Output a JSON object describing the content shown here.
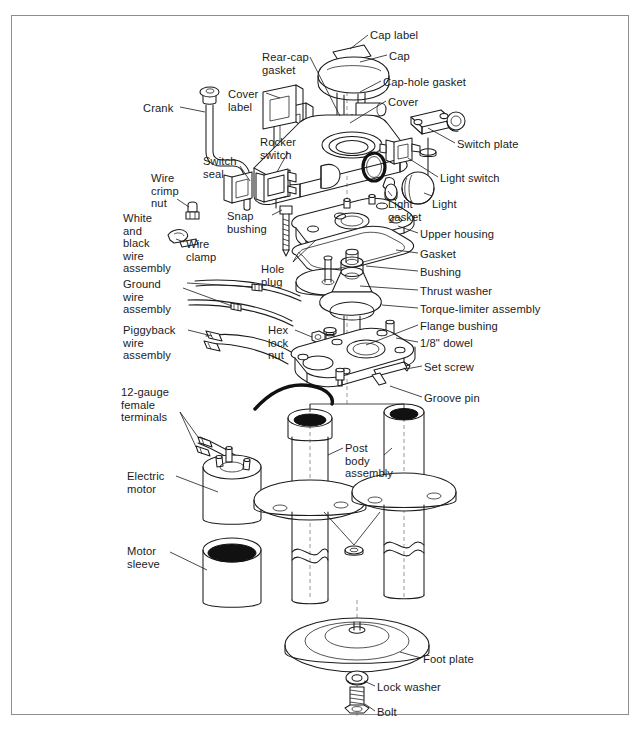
{
  "document": {
    "type": "exploded-parts-diagram",
    "subject": "Electric post / motorized column assembly",
    "border_color": "#8d8d8d",
    "line_color": "#1b1b1b",
    "background": "#ffffff"
  },
  "labels": [
    {
      "id": "cap-label",
      "text": "Cap label",
      "x": 370,
      "y": 29,
      "align": "left"
    },
    {
      "id": "cap",
      "text": "Cap",
      "x": 389,
      "y": 50,
      "align": "left"
    },
    {
      "id": "cap-hole-gasket",
      "text": "Cap-hole gasket",
      "x": 383,
      "y": 76,
      "align": "left"
    },
    {
      "id": "cover",
      "text": "Cover",
      "x": 388,
      "y": 96,
      "align": "left"
    },
    {
      "id": "rear-cap-gasket",
      "text": "Rear-cap\ngasket",
      "x": 262,
      "y": 51,
      "align": "left"
    },
    {
      "id": "cover-label",
      "text": "Cover\nlabel",
      "x": 228,
      "y": 88,
      "align": "left"
    },
    {
      "id": "crank",
      "text": "Crank",
      "x": 143,
      "y": 102,
      "align": "left"
    },
    {
      "id": "rocker-switch",
      "text": "Rocker\nswitch",
      "x": 260,
      "y": 136,
      "align": "left"
    },
    {
      "id": "switch-plate",
      "text": "Switch plate",
      "x": 457,
      "y": 138,
      "align": "left"
    },
    {
      "id": "switch-seal",
      "text": "Switch\nseal",
      "x": 203,
      "y": 155,
      "align": "left"
    },
    {
      "id": "light-switch",
      "text": "Light switch",
      "x": 440,
      "y": 172,
      "align": "left"
    },
    {
      "id": "wire-crimp-nut",
      "text": "Wire\ncrimp\nnut",
      "x": 151,
      "y": 172,
      "align": "left"
    },
    {
      "id": "light",
      "text": "Light",
      "x": 432,
      "y": 198,
      "align": "left"
    },
    {
      "id": "light-gasket",
      "text": "Light\ngasket",
      "x": 388,
      "y": 198,
      "align": "left"
    },
    {
      "id": "snap-bushing",
      "text": "Snap\nbushing",
      "x": 227,
      "y": 210,
      "align": "left"
    },
    {
      "id": "upper-housing",
      "text": "Upper housing",
      "x": 420,
      "y": 228,
      "align": "left"
    },
    {
      "id": "white-black-wire",
      "text": "White\nand\nblack\nwire\nassembly",
      "x": 123,
      "y": 212,
      "align": "left"
    },
    {
      "id": "wire-clamp",
      "text": "Wire\nclamp",
      "x": 186,
      "y": 238,
      "align": "left"
    },
    {
      "id": "gasket",
      "text": "Gasket",
      "x": 420,
      "y": 248,
      "align": "left"
    },
    {
      "id": "hole-plug",
      "text": "Hole\nplug",
      "x": 261,
      "y": 263,
      "align": "left"
    },
    {
      "id": "bushing",
      "text": "Bushing",
      "x": 420,
      "y": 266,
      "align": "left"
    },
    {
      "id": "ground-wire",
      "text": "Ground\nwire\nassembly",
      "x": 123,
      "y": 278,
      "align": "left"
    },
    {
      "id": "thrust-washer",
      "text": "Thrust washer",
      "x": 420,
      "y": 285,
      "align": "left"
    },
    {
      "id": "torque-limiter",
      "text": "Torque-limiter assembly",
      "x": 420,
      "y": 303,
      "align": "left"
    },
    {
      "id": "piggyback-wire",
      "text": "Piggyback\nwire\nassembly",
      "x": 123,
      "y": 324,
      "align": "left"
    },
    {
      "id": "flange-bushing",
      "text": "Flange bushing",
      "x": 420,
      "y": 320,
      "align": "left"
    },
    {
      "id": "hex-lock-nut",
      "text": "Hex\nlock\nnut",
      "x": 268,
      "y": 324,
      "align": "left"
    },
    {
      "id": "dowel",
      "text": "1/8\" dowel",
      "x": 420,
      "y": 337,
      "align": "left"
    },
    {
      "id": "set-screw",
      "text": "Set screw",
      "x": 424,
      "y": 361,
      "align": "left"
    },
    {
      "id": "groove-pin",
      "text": "Groove pin",
      "x": 424,
      "y": 392,
      "align": "left"
    },
    {
      "id": "twelve-gauge-terminals",
      "text": "12-gauge\nfemale\nterminals",
      "x": 121,
      "y": 386,
      "align": "left"
    },
    {
      "id": "post-body-assembly",
      "text": "Post\nbody\nassembly",
      "x": 345,
      "y": 442,
      "align": "left"
    },
    {
      "id": "electric-motor",
      "text": "Electric\nmotor",
      "x": 127,
      "y": 470,
      "align": "left"
    },
    {
      "id": "motor-sleeve",
      "text": "Motor\nsleeve",
      "x": 127,
      "y": 545,
      "align": "left"
    },
    {
      "id": "foot-plate",
      "text": "Foot plate",
      "x": 423,
      "y": 653,
      "align": "left"
    },
    {
      "id": "lock-washer",
      "text": "Lock washer",
      "x": 377,
      "y": 681,
      "align": "left"
    },
    {
      "id": "bolt",
      "text": "Bolt",
      "x": 377,
      "y": 706,
      "align": "left"
    }
  ]
}
